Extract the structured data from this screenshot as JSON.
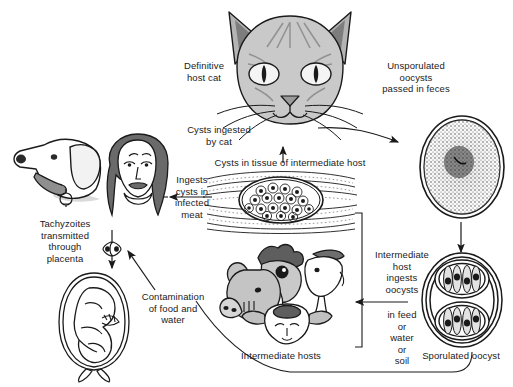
{
  "diagram": {
    "background": "#ffffff",
    "ink": "#1a1a1a",
    "fill_light": "#d8d8d8",
    "fill_mid": "#a8a8a8",
    "fill_dark": "#6b6b6b"
  },
  "labels": {
    "definitive_host": "Definitive\nhost cat",
    "unsporulated": "Unsporulated\noocysts\npassed in feces",
    "cysts_ingested": "Cysts ingested\nby cat",
    "cysts_in_tissue": "Cysts in tissue of intermediate host",
    "ingests_cysts": "Ingests\ncysts in\ninfected\nmeat",
    "tachyzoites": "Tachyzoites\ntransmitted\nthrough\nplacenta",
    "contamination": "Contamination\nof food and\nwater",
    "intermediate_ingests": "Intermediate\nhost\ningests\noocysts",
    "in_feed": "in feed\nor\nwater\nor\nsoil",
    "intermediate_hosts": "Intermediate hosts",
    "sporulated": "Sporulated oocyst"
  },
  "figures": {
    "cat": "definitive-host-cat-head",
    "dog": "dog-head",
    "woman": "woman-head",
    "fetus": "fetus-in-placenta",
    "tissue_cyst": "tissue-cyst-in-muscle",
    "intermediate_hosts": "pig-chicken-goat-sheep-heads",
    "unsporulated_oocyst": "unsporulated-oocyst",
    "sporulated_oocyst": "sporulated-oocyst",
    "tachyzoite_pair": "tachyzoite-pair"
  }
}
